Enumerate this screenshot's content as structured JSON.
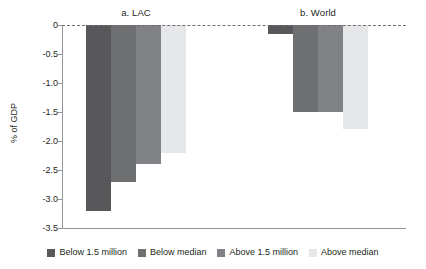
{
  "chart_data": {
    "type": "bar",
    "title": "",
    "xlabel": "",
    "ylabel": "% of GDP",
    "ylim": [
      -3.5,
      0
    ],
    "grid": false,
    "legend_position": "bottom",
    "zero_reference_line": true,
    "ytick_labels": [
      "0",
      "-0.5",
      "-1.0",
      "-1.5",
      "-2.0",
      "-2.5",
      "-3.0",
      "-3.5"
    ],
    "ytick_values": [
      0,
      -0.5,
      -1.0,
      -1.5,
      -2.0,
      -2.5,
      -3.0,
      -3.5
    ],
    "categories": [
      "a. LAC",
      "b. World"
    ],
    "series": [
      {
        "name": "Below 1.5 million",
        "color": "#58585a",
        "values": [
          -3.2,
          -0.15
        ]
      },
      {
        "name": "Below median",
        "color": "#6e6f71",
        "values": [
          -2.7,
          -1.5
        ]
      },
      {
        "name": "Above 1.5 million",
        "color": "#808285",
        "values": [
          -2.4,
          -1.5
        ]
      },
      {
        "name": "Above median",
        "color": "#e6e7e8",
        "values": [
          -2.2,
          -1.8
        ]
      }
    ],
    "panels": [
      {
        "id": "a",
        "title": "a. LAC",
        "bars": [
          {
            "series": "Below 1.5 million",
            "value": -3.2,
            "color": "#58585a"
          },
          {
            "series": "Below median",
            "value": -2.7,
            "color": "#6e6f71"
          },
          {
            "series": "Above 1.5 million",
            "value": -2.4,
            "color": "#808285"
          },
          {
            "series": "Above median",
            "value": -2.2,
            "color": "#e6e7e8"
          }
        ]
      },
      {
        "id": "b",
        "title": "b. World",
        "bars": [
          {
            "series": "Below 1.5 million",
            "value": -0.15,
            "color": "#58585a"
          },
          {
            "series": "Below median",
            "value": -1.5,
            "color": "#6e6f71"
          },
          {
            "series": "Above 1.5 million",
            "value": -1.5,
            "color": "#808285"
          },
          {
            "series": "Above median",
            "value": -1.8,
            "color": "#e6e7e8"
          }
        ]
      }
    ]
  },
  "axis": {
    "y_title": "% of GDP",
    "ticks": [
      {
        "label": "0",
        "value": 0
      },
      {
        "label": "-0.5",
        "value": -0.5
      },
      {
        "label": "-1.0",
        "value": -1.0
      },
      {
        "label": "-1.5",
        "value": -1.5
      },
      {
        "label": "-2.0",
        "value": -2.0
      },
      {
        "label": "-2.5",
        "value": -2.5
      },
      {
        "label": "-3.0",
        "value": -3.0
      },
      {
        "label": "-3.5",
        "value": -3.5
      }
    ]
  },
  "panel_titles": {
    "a": "a. LAC",
    "b": "b. World"
  },
  "legend": {
    "items": [
      {
        "label": "Below 1.5 million",
        "color": "#58585a"
      },
      {
        "label": "Below median",
        "color": "#6e6f71"
      },
      {
        "label": "Above 1.5 million",
        "color": "#808285"
      },
      {
        "label": "Above median",
        "color": "#e6e7e8"
      }
    ]
  },
  "colors": {
    "axis": "#939598",
    "text": "#231f20",
    "zero_line": "#6d6e71",
    "background": "#ffffff"
  }
}
